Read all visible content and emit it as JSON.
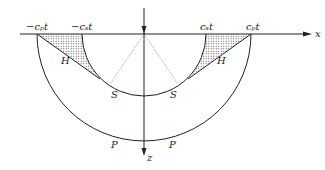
{
  "diagram": {
    "axes": {
      "x_label": "x",
      "z_label": "z"
    },
    "labels": {
      "neg_cp_t": "−cₚt",
      "neg_cs_t": "−cₛt",
      "cs_t": "cₛt",
      "cp_t": "cₚt",
      "head_wave_left": "H",
      "head_wave_right": "H",
      "s_wave_left": "S",
      "s_wave_right": "S",
      "p_wave_left": "P",
      "p_wave_right": "P"
    },
    "colors": {
      "line": "#222222",
      "hatch": "#555555"
    }
  }
}
